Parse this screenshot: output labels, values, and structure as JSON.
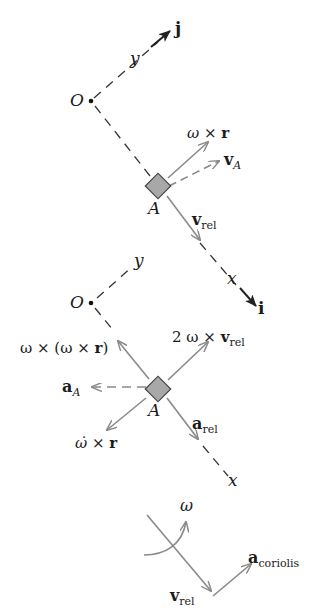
{
  "diagram": {
    "colors": {
      "axis": "#333333",
      "vector": "#8a8a8a",
      "block_fill": "#a8a8a8",
      "block_stroke": "#444444",
      "text": "#1a1a1a",
      "background": "#ffffff"
    },
    "velocity_panel": {
      "origin_label": "O",
      "axis_y_label": "y",
      "axis_x_label": "x",
      "unit_j_label": "j",
      "unit_i_label": "i",
      "point_label": "A",
      "vectors": [
        {
          "name": "omega-cross-r",
          "label_main": "ω × ",
          "label_bold": "r",
          "style": "solid"
        },
        {
          "name": "v-A",
          "label_main": "v",
          "label_sub": "A",
          "style": "dashed"
        },
        {
          "name": "v-rel",
          "label_main": "v",
          "label_sub": "rel",
          "style": "solid"
        }
      ]
    },
    "acceleration_panel": {
      "origin_label": "O",
      "axis_y_label": "y",
      "axis_x_label": "x",
      "point_label": "A",
      "vectors": [
        {
          "name": "centripetal",
          "label_pre": "ω × (ω × ",
          "label_bold": "r",
          "label_post": ")",
          "style": "solid"
        },
        {
          "name": "coriolis-term",
          "label_pre": "2 ω × ",
          "label_bold": "v",
          "label_sub": "rel",
          "style": "solid"
        },
        {
          "name": "a-A",
          "label_main": "a",
          "label_sub": "A",
          "style": "dashed"
        },
        {
          "name": "angular-accel-term",
          "label_pre": "ω̇ × ",
          "label_bold": "r",
          "style": "solid"
        },
        {
          "name": "a-rel",
          "label_main": "a",
          "label_sub": "rel",
          "style": "solid"
        }
      ]
    },
    "coriolis_panel": {
      "omega_label": "ω",
      "v_rel_main": "v",
      "v_rel_sub": "rel",
      "a_coriolis_main": "a",
      "a_coriolis_sub": "coriolis"
    }
  }
}
